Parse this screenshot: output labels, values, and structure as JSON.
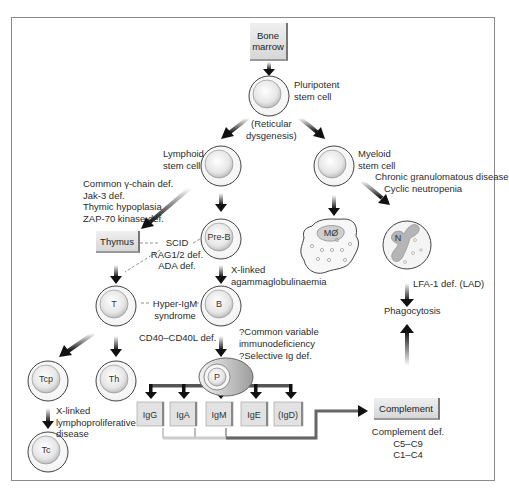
{
  "nodes": {
    "bone_marrow": "Bone marrow",
    "bone_marrow_lines": [
      "Bone",
      "marrow"
    ],
    "pluripotent": [
      "Pluripotent",
      "stem cell"
    ],
    "reticular": [
      "(Reticular",
      "dysgenesis)"
    ],
    "lymphoid": [
      "Lymphoid",
      "stem cell"
    ],
    "myeloid": [
      "Myeloid",
      "stem cell"
    ],
    "thymus": "Thymus",
    "pre_b": "Pre-B",
    "t_cell": "T",
    "b_cell": "B",
    "tcp": "Tcp",
    "th": "Th",
    "tc": "Tc",
    "plasma": "P",
    "macrophage": "MØ",
    "neutrophil": "N",
    "phagocytosis": "Phagocytosis",
    "complement": "Complement",
    "immunoglobulins": [
      "IgG",
      "IgA",
      "IgM",
      "IgE",
      "(IgD)"
    ]
  },
  "annotations": {
    "thymic_defects": [
      "Common γ-chain def.",
      "Jak-3 def.",
      "Thymic hypoplasia",
      "ZAP-70 kinase def."
    ],
    "scid": [
      "SCID",
      "RAG1/2 def.",
      "ADA def."
    ],
    "xla": [
      "X-linked",
      "agammaglobulinaemia"
    ],
    "hyper_igm": [
      "Hyper-IgM",
      "syndrome"
    ],
    "cd40": "CD40–CD40L def.",
    "cvid": [
      "?Common variable",
      "immunodeficiency"
    ],
    "selective_ig": "?Selective Ig def.",
    "xlp": [
      "X-linked",
      "lymphoproliferative",
      "disease"
    ],
    "myeloid_defects": [
      "Chronic granulomatous disease",
      "Cyclic neutropenia"
    ],
    "lad": "LFA-1 def. (LAD)",
    "complement_defects": [
      "Complement def.",
      "C5–C9",
      "C1–C4"
    ]
  }
}
